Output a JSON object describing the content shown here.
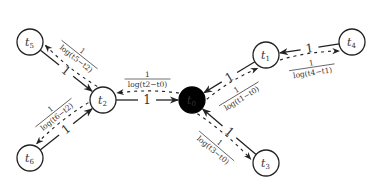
{
  "diagram": {
    "nodes": [
      {
        "id": "t0",
        "label": "t",
        "sub": "0",
        "root": true
      },
      {
        "id": "t1",
        "label": "t",
        "sub": "1",
        "root": false
      },
      {
        "id": "t2",
        "label": "t",
        "sub": "2",
        "root": false
      },
      {
        "id": "t3",
        "label": "t",
        "sub": "3",
        "root": false
      },
      {
        "id": "t4",
        "label": "t",
        "sub": "4",
        "root": false
      },
      {
        "id": "t5",
        "label": "t",
        "sub": "5",
        "root": false
      },
      {
        "id": "t6",
        "label": "t",
        "sub": "6",
        "root": false
      }
    ],
    "solid_edges": [
      {
        "from": "t1",
        "to": "t0",
        "weight": "1"
      },
      {
        "from": "t2",
        "to": "t0",
        "weight": "1"
      },
      {
        "from": "t3",
        "to": "t0",
        "weight": "1"
      },
      {
        "from": "t4",
        "to": "t1",
        "weight": "1"
      },
      {
        "from": "t5",
        "to": "t2",
        "weight": "1"
      },
      {
        "from": "t6",
        "to": "t2",
        "weight": "1"
      }
    ],
    "dashed_edges": [
      {
        "from": "t0",
        "to": "t1",
        "num": "1",
        "den": "log(t1−t0)"
      },
      {
        "from": "t0",
        "to": "t2",
        "num": "1",
        "den": "log(t2−t0)"
      },
      {
        "from": "t0",
        "to": "t3",
        "num": "1",
        "den": "log(t3−t0)"
      },
      {
        "from": "t1",
        "to": "t4",
        "num": "1",
        "den": "log(t4−t1)"
      },
      {
        "from": "t2",
        "to": "t5",
        "num": "1",
        "den": "log(t5−t2)"
      },
      {
        "from": "t2",
        "to": "t6",
        "num": "1",
        "den": "log(t6−t2)"
      }
    ]
  }
}
